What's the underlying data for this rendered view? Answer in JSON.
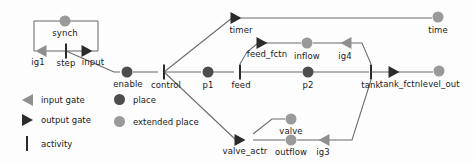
{
  "diagram": {
    "colors": {
      "place": "#4d4d4d",
      "extended_place": "#9a9a9a",
      "output_gate": "#2b2b2b",
      "input_gate": "#8f8f8f",
      "activity": "#2b2b2b",
      "wire": "#6b6b6b",
      "background": "#fdfdfd",
      "text": "#1a1a1a"
    },
    "nodes": [
      {
        "id": "synch",
        "label": "synch",
        "type": "extended-place",
        "x": 65,
        "y": 21,
        "label_x": 65,
        "label_y": 28
      },
      {
        "id": "ig1",
        "label": "ig1",
        "type": "input-gate",
        "x": 40,
        "y": 51,
        "label_x": 38,
        "label_y": 57
      },
      {
        "id": "step",
        "label": "step",
        "type": "activity",
        "x": 66,
        "y": 51,
        "label_x": 66,
        "label_y": 58
      },
      {
        "id": "input",
        "label": "input",
        "type": "output-gate",
        "x": 92,
        "y": 51,
        "label_x": 93,
        "label_y": 57
      },
      {
        "id": "enable",
        "label": "enable",
        "type": "place",
        "x": 127,
        "y": 72,
        "label_x": 128,
        "label_y": 79
      },
      {
        "id": "control",
        "label": "control",
        "type": "activity",
        "x": 164,
        "y": 72,
        "label_x": 166,
        "label_y": 80
      },
      {
        "id": "p1",
        "label": "p1",
        "type": "place",
        "x": 208,
        "y": 72,
        "label_x": 208,
        "label_y": 80
      },
      {
        "id": "feed",
        "label": "feed",
        "type": "activity",
        "x": 240,
        "y": 72,
        "label_x": 241,
        "label_y": 80
      },
      {
        "id": "p2",
        "label": "p2",
        "type": "place",
        "x": 308,
        "y": 72,
        "label_x": 308,
        "label_y": 80
      },
      {
        "id": "tank",
        "label": "tank",
        "type": "activity",
        "x": 371,
        "y": 72,
        "label_x": 371,
        "label_y": 80
      },
      {
        "id": "tank_fctn",
        "label": "tank_fctn",
        "type": "output-gate",
        "x": 398,
        "y": 72,
        "label_x": 400,
        "label_y": 79
      },
      {
        "id": "level_out",
        "label": "level_out",
        "type": "extended-place",
        "x": 439,
        "y": 71,
        "label_x": 440,
        "label_y": 79
      },
      {
        "id": "timer",
        "label": "timer",
        "type": "output-gate",
        "x": 241,
        "y": 18,
        "label_x": 241,
        "label_y": 25
      },
      {
        "id": "time",
        "label": "time",
        "type": "extended-place",
        "x": 438,
        "y": 17,
        "label_x": 438,
        "label_y": 25
      },
      {
        "id": "feed_fctn",
        "label": "feed_fctn",
        "type": "output-gate",
        "x": 266,
        "y": 43,
        "label_x": 267,
        "label_y": 49
      },
      {
        "id": "inflow",
        "label": "inflow",
        "type": "extended-place",
        "x": 307,
        "y": 43,
        "label_x": 307,
        "label_y": 51
      },
      {
        "id": "ig4",
        "label": "ig4",
        "type": "input-gate",
        "x": 345,
        "y": 43,
        "label_x": 345,
        "label_y": 51
      },
      {
        "id": "valve_actr",
        "label": "valve_actr",
        "type": "output-gate",
        "x": 244,
        "y": 140,
        "label_x": 245,
        "label_y": 146
      },
      {
        "id": "valve",
        "label": "valve",
        "type": "extended-place",
        "x": 291,
        "y": 119,
        "label_x": 291,
        "label_y": 126
      },
      {
        "id": "outflow",
        "label": "outflow",
        "type": "extended-place",
        "x": 291,
        "y": 140,
        "label_x": 291,
        "label_y": 147
      },
      {
        "id": "ig3",
        "label": "ig3",
        "type": "input-gate",
        "x": 323,
        "y": 140,
        "label_x": 323,
        "label_y": 147
      }
    ]
  },
  "legend": {
    "items": [
      {
        "icon": "input-gate-icon",
        "label": "input gate",
        "x": 20,
        "y": 94
      },
      {
        "icon": "output-gate-icon",
        "label": "output gate",
        "x": 20,
        "y": 114
      },
      {
        "icon": "activity-icon",
        "label": "activity",
        "x": 20,
        "y": 136
      },
      {
        "icon": "place-icon",
        "label": "place",
        "x": 112,
        "y": 94
      },
      {
        "icon": "extended-place-icon",
        "label": "extended place",
        "x": 112,
        "y": 116
      }
    ]
  }
}
